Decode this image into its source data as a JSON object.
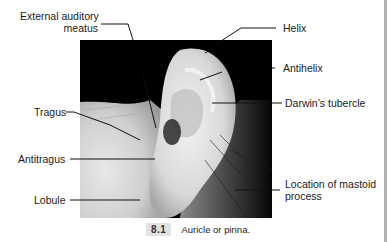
{
  "figure": {
    "number": "8.1",
    "caption": "Auricle or pinna.",
    "labels": {
      "external_auditory_meatus_line1": "External auditory",
      "external_auditory_meatus_line2": "meatus",
      "helix": "Helix",
      "antihelix": "Antihelix",
      "darwins_tubercle": "Darwin’s tubercle",
      "tragus": "Tragus",
      "antitragus": "Antitragus",
      "lobule": "Lobule",
      "mastoid_line1": "Location of mastoid",
      "mastoid_line2": "process"
    },
    "colors": {
      "leader_line": "#111111",
      "caption_badge": "#e2e2e2",
      "page_rule": "#b4b4b4"
    }
  }
}
